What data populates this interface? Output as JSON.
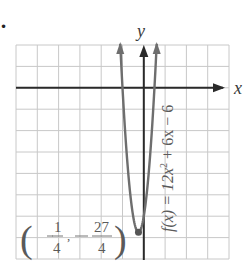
{
  "chart_data": {
    "type": "line",
    "title": "",
    "function": "f(x) = 12x^2 + 6x - 6",
    "function_label": "f(x) = 12x² + 6x − 6",
    "xlabel": "x",
    "ylabel": "y",
    "xlim": [
      -6,
      4
    ],
    "ylim": [
      -8,
      2
    ],
    "grid": true,
    "grid_step": 1,
    "axis_ticks_labeled": false,
    "vertex": {
      "x": -0.25,
      "y": -6.75,
      "label_num_x": "1",
      "label_den_x": "4",
      "label_num_y": "27",
      "label_den_y": "4",
      "label_text": "(−1/4, −27/4)"
    },
    "x_intercepts": [
      -1,
      0.5
    ],
    "y_intercept": -6,
    "series": [
      {
        "name": "f(x) = 12x² + 6x − 6",
        "x": [
          -1.29,
          -1.0,
          -0.75,
          -0.5,
          -0.25,
          0.0,
          0.25,
          0.5,
          0.79
        ],
        "y": [
          6.23,
          0.0,
          -3.75,
          -6.0,
          -6.75,
          -6.0,
          -3.75,
          0.0,
          6.23
        ]
      }
    ],
    "colors": {
      "grid": "#c8c8c8",
      "axis": "#2a2a2a",
      "curve": "#6e6e6e",
      "label": "#5a5a5a"
    }
  },
  "labels": {
    "x_axis": "x",
    "y_axis": "y",
    "equation_prefix": "f(x) = 12x",
    "equation_exp": "2",
    "equation_suffix": " + 6x − 6",
    "bullet": "•"
  }
}
